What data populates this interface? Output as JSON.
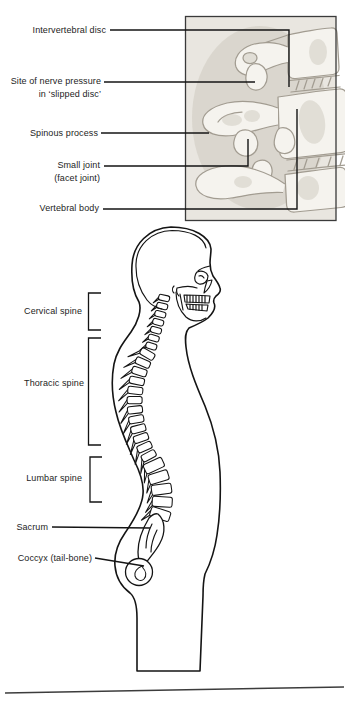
{
  "colors": {
    "ink": "#141414",
    "label": "#1d1d1d",
    "sketch_line": "#a29c91",
    "sketch_fill": "#f5f3ee",
    "sketch_bg": "#e9e6e0",
    "sketch_shade": "#c6c0b5",
    "frame": "#3a3a3a"
  },
  "inset": {
    "labels": {
      "intervertebral_disc": "Intervertebral disc",
      "nerve_pressure": "Site of nerve pressure\nin ‘slipped disc’",
      "spinous_process": "Spinous process",
      "small_joint": "Small joint\n(facet joint)",
      "vertebral_body": "Vertebral body"
    }
  },
  "figure": {
    "labels": {
      "cervical_spine": "Cervical spine",
      "thoracic_spine": "Thoracic spine",
      "lumbar_spine": "Lumbar spine",
      "sacrum": "Sacrum",
      "coccyx": "Coccyx (tail-bone)"
    }
  }
}
